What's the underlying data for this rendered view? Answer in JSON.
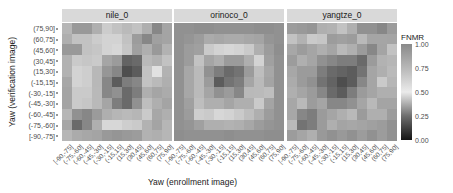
{
  "chart_data": {
    "type": "heatmap",
    "title": "",
    "xlabel": "Yaw (enrollment image)",
    "ylabel": "Yaw (verification image)",
    "legend": {
      "title": "FNMR",
      "ticks": [
        "1.00",
        "0.75",
        "0.50",
        "0.25",
        "0.00"
      ],
      "tick_values": [
        1.0,
        0.75,
        0.5,
        0.25,
        0.0
      ],
      "colormap": [
        {
          "value": 0.0,
          "color": "#141414"
        },
        {
          "value": 0.25,
          "color": "#6e6e6e"
        },
        {
          "value": 0.5,
          "color": "#ebebeb"
        },
        {
          "value": 0.75,
          "color": "#b8b8b8"
        },
        {
          "value": 1.0,
          "color": "#8a8a8a"
        }
      ]
    },
    "x_categories": [
      "[-90,-75]",
      "(-75,-60]",
      "(-60,-45]",
      "(-45,-30]",
      "(-30,-15]",
      "(-15,15]",
      "(15,30]",
      "(30,45]",
      "(45,60]",
      "(60,75]",
      "(75,90]"
    ],
    "y_categories_top_to_bottom": [
      "(75,90]",
      "(60,75]",
      "(45,60]",
      "(30,45]",
      "(15,30]",
      "(-15,15]",
      "(-30,-15]",
      "(-45,-30]",
      "(-60,-45]",
      "(-75,-60]",
      "[-90,-75]"
    ],
    "facets": [
      {
        "name": "nile_0",
        "values": [
          [
            0.76,
            0.92,
            0.92,
            0.8,
            0.65,
            0.7,
            0.74,
            0.7,
            0.8,
            0.3,
            0.86
          ],
          [
            0.8,
            0.7,
            0.7,
            0.65,
            0.62,
            0.62,
            0.7,
            0.9,
            0.3,
            0.35,
            0.86
          ],
          [
            0.92,
            0.92,
            0.7,
            0.68,
            0.62,
            0.6,
            0.68,
            0.35,
            0.38,
            0.92,
            0.78
          ],
          [
            0.78,
            0.66,
            0.68,
            0.66,
            0.36,
            0.34,
            0.22,
            0.24,
            0.4,
            0.78,
            0.7
          ],
          [
            0.78,
            0.62,
            0.64,
            0.75,
            0.33,
            0.3,
            0.16,
            0.2,
            0.7,
            0.55,
            0.78
          ],
          [
            0.84,
            0.62,
            0.64,
            0.75,
            0.3,
            0.2,
            0.28,
            0.3,
            0.42,
            0.74,
            0.8
          ],
          [
            0.86,
            0.66,
            0.66,
            0.4,
            0.3,
            0.32,
            0.24,
            0.28,
            0.8,
            0.36,
            0.82
          ],
          [
            0.86,
            0.66,
            0.68,
            0.4,
            0.36,
            0.28,
            0.24,
            0.32,
            0.72,
            0.8,
            0.86
          ],
          [
            0.76,
            0.32,
            0.3,
            0.34,
            0.8,
            0.76,
            0.74,
            0.76,
            0.66,
            0.84,
            0.8
          ],
          [
            0.36,
            0.24,
            0.3,
            0.8,
            0.6,
            0.6,
            0.64,
            0.66,
            0.78,
            0.86,
            0.76
          ],
          [
            0.76,
            0.82,
            0.84,
            0.86,
            0.92,
            0.94,
            0.92,
            0.9,
            0.78,
            0.8,
            0.76
          ]
        ]
      },
      {
        "name": "orinoco_0",
        "values": [
          [
            0.96,
            0.96,
            0.98,
            0.98,
            0.96,
            0.96,
            0.96,
            0.96,
            0.98,
            0.98,
            0.96
          ],
          [
            0.96,
            0.94,
            0.9,
            0.82,
            0.84,
            0.82,
            0.82,
            0.84,
            0.86,
            0.94,
            0.96
          ],
          [
            0.96,
            0.9,
            0.88,
            0.66,
            0.62,
            0.6,
            0.62,
            0.66,
            0.8,
            0.9,
            0.98
          ],
          [
            0.96,
            0.9,
            0.7,
            0.36,
            0.38,
            0.34,
            0.34,
            0.38,
            0.62,
            0.88,
            0.96
          ],
          [
            0.96,
            0.84,
            0.74,
            0.32,
            0.28,
            0.24,
            0.26,
            0.34,
            0.72,
            0.84,
            0.96
          ],
          [
            0.96,
            0.84,
            0.74,
            0.34,
            0.2,
            0.26,
            0.28,
            0.36,
            0.74,
            0.86,
            0.96
          ],
          [
            0.96,
            0.84,
            0.74,
            0.36,
            0.32,
            0.34,
            0.3,
            0.4,
            0.74,
            0.72,
            0.96
          ],
          [
            0.96,
            0.88,
            0.72,
            0.38,
            0.38,
            0.36,
            0.38,
            0.8,
            0.66,
            0.86,
            0.96
          ],
          [
            0.96,
            0.9,
            0.64,
            0.66,
            0.6,
            0.62,
            0.66,
            0.72,
            0.8,
            0.9,
            0.96
          ],
          [
            0.96,
            0.94,
            0.88,
            0.8,
            0.8,
            0.78,
            0.8,
            0.84,
            0.9,
            0.94,
            0.96
          ],
          [
            0.98,
            0.96,
            0.96,
            0.96,
            0.96,
            0.98,
            0.96,
            0.96,
            0.96,
            0.98,
            0.98
          ]
        ]
      },
      {
        "name": "yangtze_0",
        "values": [
          [
            0.9,
            0.92,
            0.94,
            0.8,
            0.78,
            0.7,
            0.8,
            0.96,
            0.32,
            0.3,
            0.34
          ],
          [
            0.7,
            0.78,
            0.66,
            0.68,
            0.9,
            0.88,
            0.9,
            0.4,
            0.36,
            0.36,
            0.86
          ],
          [
            0.84,
            0.9,
            0.36,
            0.38,
            0.36,
            0.4,
            0.38,
            0.34,
            0.3,
            0.86,
            0.7
          ],
          [
            0.9,
            0.38,
            0.36,
            0.32,
            0.3,
            0.28,
            0.28,
            0.24,
            0.34,
            0.78,
            0.76
          ],
          [
            0.84,
            0.34,
            0.34,
            0.28,
            0.24,
            0.22,
            0.2,
            0.26,
            0.36,
            0.8,
            0.74
          ],
          [
            0.82,
            0.34,
            0.32,
            0.26,
            0.22,
            0.16,
            0.2,
            0.3,
            0.36,
            0.66,
            0.76
          ],
          [
            0.8,
            0.36,
            0.34,
            0.3,
            0.24,
            0.2,
            0.28,
            0.34,
            0.36,
            0.8,
            0.8
          ],
          [
            0.84,
            0.4,
            0.9,
            0.36,
            0.3,
            0.3,
            0.32,
            0.36,
            0.4,
            0.86,
            0.86
          ],
          [
            0.84,
            0.3,
            0.28,
            0.34,
            0.36,
            0.38,
            0.4,
            0.34,
            0.38,
            0.8,
            0.9
          ],
          [
            0.4,
            0.26,
            0.28,
            0.34,
            0.8,
            0.86,
            0.84,
            0.86,
            0.88,
            0.9,
            0.96
          ],
          [
            0.9,
            0.36,
            0.8,
            0.92,
            0.96,
            0.92,
            0.96,
            0.9,
            0.96,
            0.9,
            0.96
          ]
        ]
      }
    ]
  },
  "facets": {
    "nile_0": {
      "label": "nile_0"
    },
    "orinoco_0": {
      "label": "orinoco_0"
    },
    "yangtze_0": {
      "label": "yangtze_0"
    }
  },
  "axes": {
    "xlabel": "Yaw (enrollment image)",
    "ylabel": "Yaw (verification image)"
  },
  "legend": {
    "title": "FNMR",
    "ticks": [
      "1.00",
      "0.75",
      "0.50",
      "0.25",
      "0.00"
    ]
  }
}
